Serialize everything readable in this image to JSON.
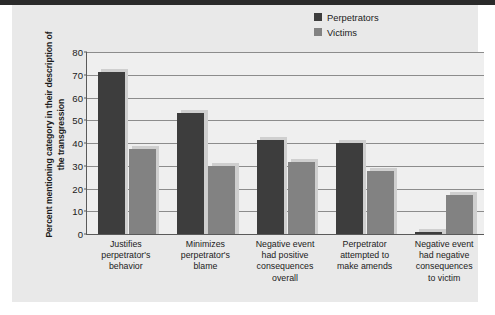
{
  "chart_data": {
    "type": "bar",
    "title": "",
    "subtitle": "",
    "xlabel": "",
    "ylabel": "Percent mentioning category in their description of the transgression",
    "ylim": [
      0,
      80
    ],
    "ytick_values": [
      0,
      10,
      20,
      30,
      40,
      50,
      60,
      70,
      80
    ],
    "ytick_labels": [
      "0",
      "10",
      "20",
      "30",
      "40",
      "50",
      "60",
      "70",
      "80"
    ],
    "grid": "horizontal",
    "legend_position": "top-right",
    "categories": [
      "Justifies perpetrator's behavior",
      "Minimizes perpetrator's blame",
      "Negative event had positive consequences overall",
      "Perpetrator attempted to make amends",
      "Negative event had negative consequences to victim"
    ],
    "category_lines": [
      [
        "Justifies",
        "perpetrator's",
        "behavior"
      ],
      [
        "Minimizes",
        "perpetrator's",
        "blame"
      ],
      [
        "Negative event",
        "had positive",
        "consequences",
        "overall"
      ],
      [
        "Perpetrator",
        "attempted to",
        "make amends"
      ],
      [
        "Negative event",
        "had negative",
        "consequences",
        "to victim"
      ]
    ],
    "series": [
      {
        "name": "Perpetrators",
        "color": "#3d3d3d",
        "values": [
          71,
          53,
          41.5,
          40,
          1
        ]
      },
      {
        "name": "Victims",
        "color": "#828282",
        "values": [
          37.5,
          30,
          31.5,
          27.5,
          17
        ]
      }
    ]
  },
  "legend": {
    "items": [
      {
        "label": "Perpetrators",
        "color": "#3d3d3d"
      },
      {
        "label": "Victims",
        "color": "#828282"
      }
    ]
  },
  "colors": {
    "page_background": "#e9e9e9",
    "plot_background": "#efefef",
    "axis": "#5a5a5a",
    "gridline": "#8c8c8c",
    "bar_shadow": "#cfcfcf",
    "text": "#1b1b1b"
  }
}
